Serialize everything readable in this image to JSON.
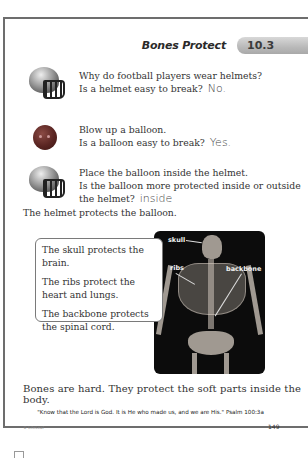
{
  "header": {
    "title": "Bones Protect",
    "lesson_number": "10.3"
  },
  "items": [
    {
      "icon": "helmet-icon",
      "lines": [
        "Why do football players wear helmets?",
        "Is a helmet easy to break?"
      ],
      "answer": "No."
    },
    {
      "icon": "balloon-icon",
      "lines": [
        "Blow up a balloon.",
        "Is a balloon easy to break?"
      ],
      "answer": "Yes."
    },
    {
      "icon": "helmet-icon",
      "lines": [
        "Place the balloon inside the helmet.",
        "Is the balloon more protected inside or outside",
        "the helmet?"
      ],
      "answer": "inside"
    }
  ],
  "statement": "The helmet protects the balloon.",
  "callout": [
    "The skull protects the brain.",
    "The ribs protect the heart and lungs.",
    "The backbone protects the spinal cord."
  ],
  "skeleton_labels": {
    "skull": "skull",
    "ribs": "ribs",
    "backbone": "backbone"
  },
  "summary": "Bones are hard. They protect the soft parts inside the body.",
  "verse": "\"Know that the Lord is God. It is He who made us, and we are His.\" Psalm 100:3a",
  "footer": {
    "publisher": "© LifeLeaf",
    "page_number": "149"
  }
}
